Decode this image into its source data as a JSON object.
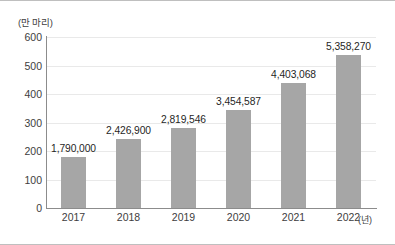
{
  "chart_data": {
    "type": "bar",
    "title": "",
    "subtitle": "",
    "xlabel": "(년)",
    "ylabel": "(만 마리)",
    "categories": [
      "2017",
      "2018",
      "2019",
      "2020",
      "2021",
      "2022"
    ],
    "values": [
      179.0,
      242.69,
      281.9546,
      345.4587,
      440.3068,
      535.827
    ],
    "data_labels": [
      "1,790,000",
      "2,426,900",
      "2,819,546",
      "3,454,587",
      "4,403,068",
      "5,358,270"
    ],
    "ylim": [
      0,
      600
    ],
    "yticks": [
      0,
      100,
      200,
      300,
      400,
      500,
      600
    ],
    "ytick_labels": [
      "0",
      "100",
      "200",
      "300",
      "400",
      "500",
      "600"
    ],
    "grid": true,
    "legend": false,
    "series": [
      {
        "name": "",
        "values": [
          179.0,
          242.69,
          281.9546,
          345.4587,
          440.3068,
          535.827
        ]
      }
    ],
    "colors": {
      "bar": "#a6a6a6",
      "axis": "#8c8c8c",
      "grid": "#e9e9e9",
      "text": "#3d3d3d",
      "border": "#bfbfbf"
    }
  }
}
